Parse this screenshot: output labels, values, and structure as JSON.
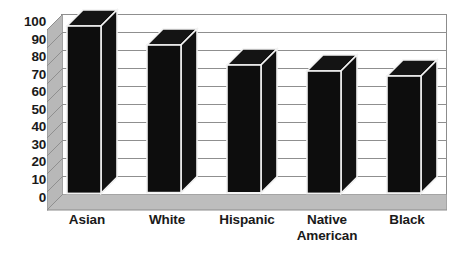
{
  "chart_data": {
    "type": "bar",
    "title": "",
    "subtitle": "",
    "xlabel": "",
    "ylabel": "",
    "categories": [
      "Asian",
      "White",
      "Hispanic",
      "Native American",
      "Black"
    ],
    "values": [
      93,
      82,
      71,
      68,
      65
    ],
    "ylim": [
      0,
      100
    ],
    "yticks": [
      0,
      10,
      20,
      30,
      40,
      50,
      60,
      70,
      80,
      90,
      100
    ],
    "ytick_labels": [
      "0",
      "10",
      "20",
      "30",
      "40",
      "50",
      "60",
      "70",
      "80",
      "90",
      "100"
    ],
    "grid": true,
    "legend": false,
    "legend_position": "none",
    "style": "3d-column",
    "series": [
      {
        "name": "",
        "values": [
          93,
          82,
          71,
          68,
          65
        ]
      }
    ],
    "annotations": [],
    "colors": {
      "bar_fill": "#0d0d0d",
      "bar_side": "#111111",
      "bar_top": "#141414",
      "bar_edge": "#f2f2f2",
      "gridline": "#8f8f8f",
      "wall_fill": "#ffffff",
      "floor_fill": "#b5b5b5",
      "axis_text": "#1a1a1a",
      "background": "#ffffff"
    }
  },
  "axis": {
    "y_ticks": [
      "100",
      "90",
      "80",
      "70",
      "60",
      "50",
      "40",
      "30",
      "20",
      "10",
      "0"
    ],
    "x_labels": [
      {
        "line1": "Asian",
        "line2": ""
      },
      {
        "line1": "White",
        "line2": ""
      },
      {
        "line1": "Hispanic",
        "line2": ""
      },
      {
        "line1": "Native",
        "line2": "American"
      },
      {
        "line1": "Black",
        "line2": ""
      }
    ]
  }
}
